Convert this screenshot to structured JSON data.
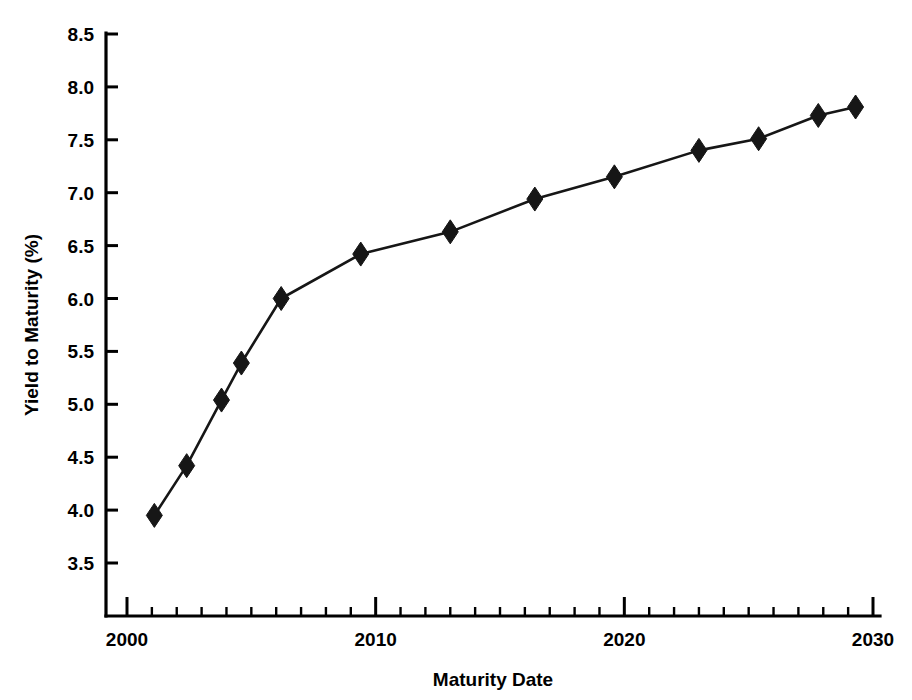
{
  "chart_data": {
    "type": "line",
    "title": "",
    "subtitle": "",
    "xlabel": "Maturity Date",
    "ylabel": "Yield to Maturity (%)",
    "xlim": [
      2000,
      2030.5
    ],
    "ylim": [
      3.25,
      8.5
    ],
    "grid": false,
    "legend": null,
    "legend_position": "none",
    "marker": "filled-diamond",
    "line_color": "#161616",
    "marker_color": "#161616",
    "background_color": "#ffffff",
    "x_tick_labels": [
      "2000",
      "2010",
      "2020",
      "2030"
    ],
    "x_tick_values": [
      2000,
      2010,
      2020,
      2030
    ],
    "x_minor_tick_interval": 1,
    "y_tick_labels": [
      "3.5",
      "4.0",
      "4.5",
      "5.0",
      "5.5",
      "6.0",
      "6.5",
      "7.0",
      "7.5",
      "8.0",
      "8.5"
    ],
    "y_tick_values": [
      3.5,
      4.0,
      4.5,
      5.0,
      5.5,
      6.0,
      6.5,
      7.0,
      7.5,
      8.0,
      8.5
    ],
    "x": [
      2001.1,
      2002.4,
      2003.8,
      2004.6,
      2006.2,
      2009.4,
      2013.0,
      2016.4,
      2019.6,
      2023.0,
      2025.4,
      2027.8,
      2029.3
    ],
    "values": [
      3.95,
      4.42,
      5.04,
      5.39,
      6.0,
      6.42,
      6.63,
      6.94,
      7.15,
      7.4,
      7.51,
      7.73,
      7.81
    ],
    "series": [
      {
        "name": "Yield to Maturity",
        "x": [
          2001.1,
          2002.4,
          2003.8,
          2004.6,
          2006.2,
          2009.4,
          2013.0,
          2016.4,
          2019.6,
          2023.0,
          2025.4,
          2027.8,
          2029.3
        ],
        "values": [
          3.95,
          4.42,
          5.04,
          5.39,
          6.0,
          6.42,
          6.63,
          6.94,
          7.15,
          7.4,
          7.51,
          7.73,
          7.81
        ]
      }
    ],
    "annotations": []
  },
  "axes": {
    "y_axis_title": "Yield to Maturity (%)",
    "x_axis_title": "Maturity Date"
  }
}
